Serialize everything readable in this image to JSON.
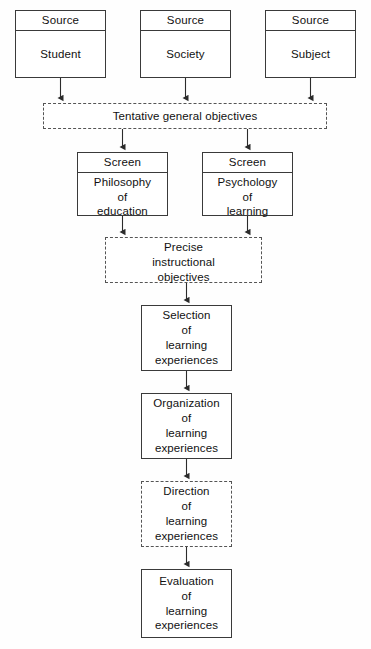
{
  "diagram": {
    "colors": {
      "background": "#fefefe",
      "solid_border": "#3a3a3a",
      "dashed_border": "#555555",
      "text": "#111111",
      "connector": "#2b2b2b"
    },
    "nodes": [
      {
        "id": "source-student",
        "header": "Source",
        "body": "Student",
        "style": "solid",
        "x": 15,
        "y": 10,
        "w": 91,
        "h": 68
      },
      {
        "id": "source-society",
        "header": "Source",
        "body": "Society",
        "style": "solid",
        "x": 140,
        "y": 10,
        "w": 91,
        "h": 68
      },
      {
        "id": "source-subject",
        "header": "Source",
        "body": "Subject",
        "style": "solid",
        "x": 265,
        "y": 10,
        "w": 91,
        "h": 68
      },
      {
        "id": "tentative-general-objectives",
        "header": "",
        "body": "Tentative general objectives",
        "style": "dashed",
        "x": 43,
        "y": 103,
        "w": 284,
        "h": 26
      },
      {
        "id": "screen-philosophy",
        "header": "Screen",
        "body": "Philosophy\nof\neducation",
        "style": "solid",
        "x": 77,
        "y": 152,
        "w": 91,
        "h": 64
      },
      {
        "id": "screen-psychology",
        "header": "Screen",
        "body": "Psychology\nof\nlearning",
        "style": "solid",
        "x": 202,
        "y": 152,
        "w": 91,
        "h": 64
      },
      {
        "id": "precise-instructional-objectives",
        "header": "",
        "body": "Precise\ninstructional\nobjectives",
        "style": "dashed",
        "x": 105,
        "y": 237,
        "w": 157,
        "h": 46
      },
      {
        "id": "selection-of-learning-experiences",
        "header": "",
        "body": "Selection\nof\nlearning\nexperiences",
        "style": "solid",
        "x": 141,
        "y": 305,
        "w": 91,
        "h": 66
      },
      {
        "id": "organization-of-learning-experiences",
        "header": "",
        "body": "Organization\nof\nlearning\nexperiences",
        "style": "solid",
        "x": 141,
        "y": 393,
        "w": 91,
        "h": 66
      },
      {
        "id": "direction-of-learning-experiences",
        "header": "",
        "body": "Direction\nof\nlearning\nexperiences",
        "style": "dashed",
        "x": 141,
        "y": 481,
        "w": 91,
        "h": 66
      },
      {
        "id": "evaluation-of-learning-experiences",
        "header": "",
        "body": "Evaluation\nof\nlearning\nexperiences",
        "style": "solid",
        "x": 141,
        "y": 569,
        "w": 91,
        "h": 69
      }
    ],
    "connectors": [
      {
        "from": "source-student",
        "to": "tentative-general-objectives",
        "path": "M60.5,78 L60.5,98"
      },
      {
        "from": "source-society",
        "to": "tentative-general-objectives",
        "path": "M185.5,78 L185.5,98"
      },
      {
        "from": "source-subject",
        "to": "tentative-general-objectives",
        "path": "M310.5,78 L310.5,98"
      },
      {
        "from": "tentative-general-objectives",
        "to": "screen-philosophy",
        "path": "M122.5,129 L122.5,147"
      },
      {
        "from": "tentative-general-objectives",
        "to": "screen-psychology",
        "path": "M247.5,129 L247.5,147"
      },
      {
        "from": "screen-philosophy",
        "to": "precise-instructional-objectives",
        "path": "M122.5,216 L122.5,232"
      },
      {
        "from": "screen-psychology",
        "to": "precise-instructional-objectives",
        "path": "M247.5,216 L247.5,232"
      },
      {
        "from": "precise-instructional-objectives",
        "to": "selection-of-learning-experiences",
        "path": "M186.5,283 L186.5,300"
      },
      {
        "from": "selection-of-learning-experiences",
        "to": "organization-of-learning-experiences",
        "path": "M186.5,371 L186.5,388"
      },
      {
        "from": "organization-of-learning-experiences",
        "to": "direction-of-learning-experiences",
        "path": "M186.5,459 L186.5,476"
      },
      {
        "from": "direction-of-learning-experiences",
        "to": "evaluation-of-learning-experiences",
        "path": "M186.5,547 L186.5,564"
      }
    ]
  }
}
